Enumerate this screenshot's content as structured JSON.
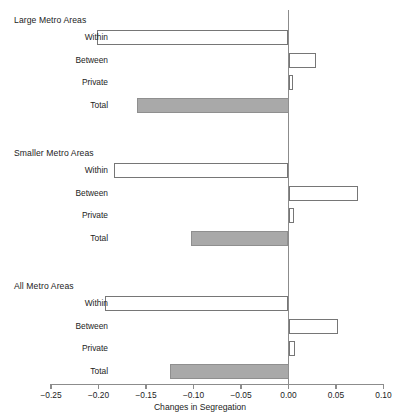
{
  "chart_data": {
    "type": "bar",
    "orientation": "horizontal",
    "title": "",
    "xlabel": "Changes in Segregation",
    "ylabel": "",
    "xlim": [
      -0.27,
      0.105
    ],
    "xticks": [
      -0.25,
      -0.2,
      -0.15,
      -0.1,
      -0.05,
      0.0,
      0.05,
      0.1
    ],
    "xticklabels": [
      "−0.25",
      "−0.20",
      "−0.15",
      "−0.10",
      "−0.05",
      "0.00",
      "0.05",
      "0.10"
    ],
    "grid": false,
    "legend": false,
    "zero_line": 0.0,
    "categories": [
      "Within",
      "Between",
      "Private",
      "Total"
    ],
    "groups": [
      {
        "name": "Large Metro Areas",
        "bars": [
          {
            "label": "Within",
            "value": -0.202,
            "style": "open"
          },
          {
            "label": "Between",
            "value": 0.029,
            "style": "open"
          },
          {
            "label": "Private",
            "value": 0.005,
            "style": "open"
          },
          {
            "label": "Total",
            "value": -0.16,
            "style": "filled"
          }
        ]
      },
      {
        "name": "Smaller Metro Areas",
        "bars": [
          {
            "label": "Within",
            "value": -0.184,
            "style": "open"
          },
          {
            "label": "Between",
            "value": 0.073,
            "style": "open"
          },
          {
            "label": "Private",
            "value": 0.006,
            "style": "open"
          },
          {
            "label": "Total",
            "value": -0.103,
            "style": "filled"
          }
        ]
      },
      {
        "name": "All Metro Areas",
        "bars": [
          {
            "label": "Within",
            "value": -0.193,
            "style": "open"
          },
          {
            "label": "Between",
            "value": 0.052,
            "style": "open"
          },
          {
            "label": "Private",
            "value": 0.007,
            "style": "open"
          },
          {
            "label": "Total",
            "value": -0.125,
            "style": "filled"
          }
        ]
      }
    ],
    "colors": {
      "open_fill": "#ffffff",
      "open_stroke": "#767676",
      "filled_fill": "#a9a9a9",
      "filled_stroke": "#8f8f8f",
      "axis": "#8c8c8c",
      "text": "#1c1c1c"
    }
  }
}
